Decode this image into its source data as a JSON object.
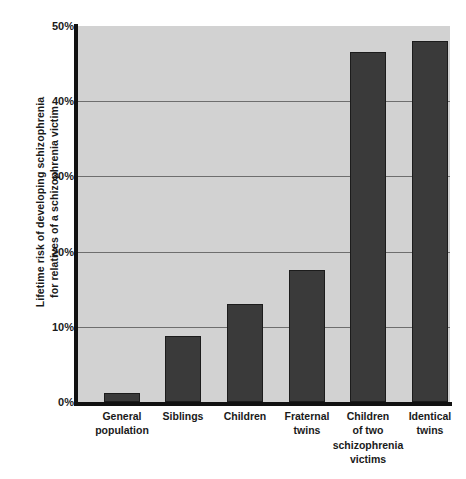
{
  "chart_data": {
    "type": "bar",
    "title": "",
    "subtitle": "",
    "xlabel": "",
    "ylabel": "Lifetime risk of developing schizophrenia for relatives of a schizophrenia victim",
    "ylabel_lines": [
      "Lifetime risk of developing schizophrenia",
      "for relatives of a schizophrenia victim"
    ],
    "categories": [
      "General population",
      "Siblings",
      "Children",
      "Fraternal twins",
      "Children of two schizophrenia victims",
      "Identical twins"
    ],
    "category_lines": [
      [
        "General",
        "population"
      ],
      [
        "Siblings"
      ],
      [
        "Children"
      ],
      [
        "Fraternal",
        "twins"
      ],
      [
        "Children",
        "of two",
        "schizophrenia",
        "victims"
      ],
      [
        "Identical",
        "twins"
      ]
    ],
    "values": [
      1.2,
      8.8,
      13.0,
      17.5,
      46.5,
      48.0
    ],
    "value_unit": "%",
    "ylim": [
      0,
      50
    ],
    "ytick_values": [
      0,
      10,
      20,
      30,
      40,
      50
    ],
    "ytick_labels": [
      "0%",
      "10%",
      "20%",
      "30%",
      "40%",
      "50%"
    ],
    "grid": true,
    "grid_axis": "y",
    "legend": false,
    "legend_position": "none",
    "series": [
      {
        "name": "Lifetime risk",
        "values": [
          1.2,
          8.8,
          13.0,
          17.5,
          46.5,
          48.0
        ]
      }
    ],
    "colors": {
      "bar": "#3a3a3a",
      "bar_border": "#1c1c1c",
      "plot_background": "#d2d2d2",
      "gridline": "#6e6e6e",
      "axis": "#111111",
      "text": "#1a1a1a",
      "page_background": "#ffffff"
    }
  }
}
